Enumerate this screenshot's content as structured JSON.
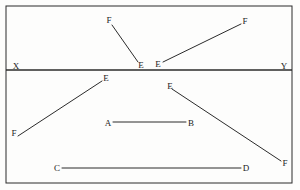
{
  "figure": {
    "background_color": "#fdfdfc",
    "stroke_color": "#2b2b2b",
    "label_color": "#1a1a1a",
    "frame": {
      "name": "outer-rectangle-border",
      "x": 6,
      "y": 6,
      "width": 286,
      "height": 177
    },
    "divider": {
      "name": "horizontal-divider-line-xy",
      "x1": 6,
      "y1": 70,
      "x2": 292,
      "y2": 70
    },
    "upper_region": {
      "name": "upper-band",
      "segments": [
        {
          "id": "seg-fe-upper-left",
          "from_label": "F",
          "to_label": "E",
          "x1": 112,
          "y1": 25,
          "x2": 138,
          "y2": 62
        },
        {
          "id": "seg-ef-upper-right",
          "from_label": "E",
          "to_label": "F",
          "x1": 163,
          "y1": 62,
          "x2": 241,
          "y2": 24
        }
      ],
      "labels": [
        {
          "id": "label-f-upper-left",
          "text": "F",
          "x": 109,
          "y": 20
        },
        {
          "id": "label-e-upper-left",
          "text": "E",
          "x": 141,
          "y": 65
        },
        {
          "id": "label-e-upper-right",
          "text": "E",
          "x": 158,
          "y": 64
        },
        {
          "id": "label-f-upper-right",
          "text": "F",
          "x": 245,
          "y": 21
        }
      ]
    },
    "divider_labels": [
      {
        "id": "label-x-left",
        "text": "X",
        "x": 16,
        "y": 66
      },
      {
        "id": "label-y-right",
        "text": "Y",
        "x": 284,
        "y": 66
      }
    ],
    "lower_region": {
      "name": "lower-band",
      "segments": [
        {
          "id": "seg-fe-lower-left",
          "from_label": "F",
          "to_label": "E",
          "x1": 18,
          "y1": 136,
          "x2": 102,
          "y2": 81
        },
        {
          "id": "seg-ab-middle",
          "from_label": "A",
          "to_label": "B",
          "x1": 113,
          "y1": 122,
          "x2": 186,
          "y2": 122
        },
        {
          "id": "seg-ef-lower-right",
          "from_label": "E",
          "to_label": "F",
          "x1": 172,
          "y1": 89,
          "x2": 281,
          "y2": 161
        },
        {
          "id": "seg-cd-bottom",
          "from_label": "C",
          "to_label": "D",
          "x1": 62,
          "y1": 168,
          "x2": 241,
          "y2": 168
        }
      ],
      "labels": [
        {
          "id": "label-f-lower-left",
          "text": "F",
          "x": 14,
          "y": 133
        },
        {
          "id": "label-e-lower-left",
          "text": "E",
          "x": 106,
          "y": 78
        },
        {
          "id": "label-a-middle",
          "text": "A",
          "x": 108,
          "y": 123
        },
        {
          "id": "label-b-middle",
          "text": "B",
          "x": 191,
          "y": 123
        },
        {
          "id": "label-e-lower-right",
          "text": "E",
          "x": 170,
          "y": 86
        },
        {
          "id": "label-f-lower-right",
          "text": "F",
          "x": 285,
          "y": 163
        },
        {
          "id": "label-c-bottom",
          "text": "C",
          "x": 57,
          "y": 168
        },
        {
          "id": "label-d-bottom",
          "text": "D",
          "x": 246,
          "y": 168
        }
      ]
    }
  }
}
